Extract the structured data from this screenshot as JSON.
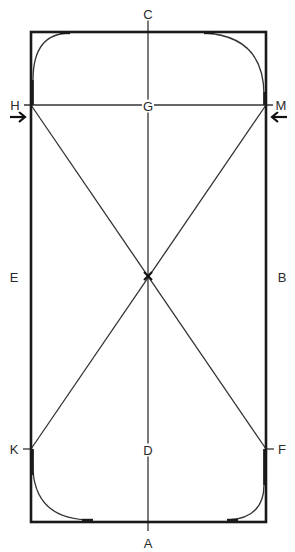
{
  "diagram": {
    "colors": {
      "background": "#ffffff",
      "arena_border": "#1a1a1a",
      "lines": "#333333",
      "labels": "#2a2a2a"
    },
    "arena": {
      "x": 31,
      "y": 32,
      "width": 235,
      "height": 490
    },
    "markers": [
      {
        "id": "C",
        "label": "C",
        "x": 148,
        "y": 14,
        "position": "top-center"
      },
      {
        "id": "H",
        "label": "H",
        "x": 15,
        "y": 105,
        "position": "left-upper"
      },
      {
        "id": "G",
        "label": "G",
        "x": 148,
        "y": 105,
        "position": "centerline-upper"
      },
      {
        "id": "M",
        "label": "M",
        "x": 281,
        "y": 105,
        "position": "right-upper"
      },
      {
        "id": "E",
        "label": "E",
        "x": 14,
        "y": 276,
        "position": "left-middle"
      },
      {
        "id": "B",
        "label": "B",
        "x": 282,
        "y": 276,
        "position": "right-middle"
      },
      {
        "id": "K",
        "label": "K",
        "x": 14,
        "y": 449,
        "position": "left-lower"
      },
      {
        "id": "D",
        "label": "D",
        "x": 148,
        "y": 449,
        "position": "centerline-lower"
      },
      {
        "id": "F",
        "label": "F",
        "x": 282,
        "y": 449,
        "position": "right-lower"
      },
      {
        "id": "A",
        "label": "A",
        "x": 148,
        "y": 543,
        "position": "bottom-center"
      }
    ],
    "center_point": {
      "label": "X",
      "x": 148,
      "y": 276
    },
    "paths": [
      {
        "name": "centerline",
        "from": "C",
        "to": "A"
      },
      {
        "name": "h-m-line",
        "from": "H",
        "to": "M"
      },
      {
        "name": "diagonal-h-f",
        "from": "H",
        "to": "F"
      },
      {
        "name": "diagonal-m-k",
        "from": "M",
        "to": "K"
      }
    ],
    "arrows": [
      {
        "name": "arrow-at-h",
        "direction": "right"
      },
      {
        "name": "arrow-at-m",
        "direction": "left"
      }
    ]
  }
}
